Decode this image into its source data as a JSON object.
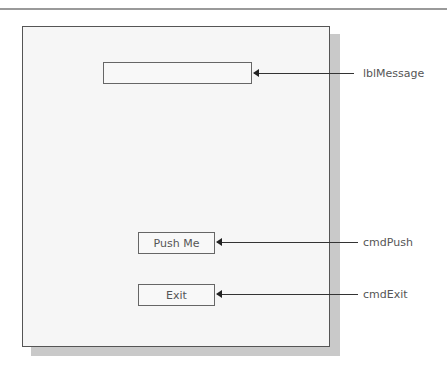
{
  "diagram": {
    "form": {
      "controls": {
        "label_message": {
          "name": "lblMessage",
          "text": ""
        },
        "push_button": {
          "name": "cmdPush",
          "text": "Push Me"
        },
        "exit_button": {
          "name": "cmdExit",
          "text": "Exit"
        }
      }
    },
    "callouts": [
      {
        "label": "lblMessage"
      },
      {
        "label": "cmdPush"
      },
      {
        "label": "cmdExit"
      }
    ]
  }
}
